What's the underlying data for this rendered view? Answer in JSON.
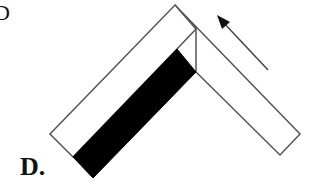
{
  "option_label": "D.",
  "clipped_top_left_label": "D",
  "diagram": {
    "colors": {
      "stroke": "#555555",
      "fill_dark": "#000000",
      "fill_light": "#ffffff"
    }
  }
}
